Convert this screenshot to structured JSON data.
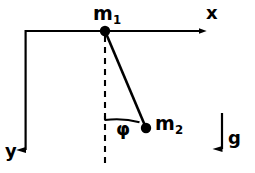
{
  "figure": {
    "background_color": "#ffffff",
    "stroke_color": "#000000",
    "width": 255,
    "height": 173,
    "labels": {
      "m1": {
        "base": "m",
        "sub": "1"
      },
      "m2": {
        "base": "m",
        "sub": "2"
      },
      "phi": "φ",
      "x_axis": "x",
      "y_axis": "y",
      "gravity": "g"
    },
    "geometry": {
      "origin": {
        "x": 25,
        "y": 31
      },
      "pivot_m1": {
        "x": 105,
        "y": 31,
        "radius": 5
      },
      "bob_m2": {
        "x": 146,
        "y": 128,
        "radius": 5
      },
      "x_axis_line": {
        "x1": 25,
        "y1": 31,
        "x2": 200,
        "y2": 31
      },
      "y_axis_line": {
        "x1": 25,
        "y1": 31,
        "x2": 25,
        "y2": 152
      },
      "gravity_arrow": {
        "x1": 222,
        "y1": 113,
        "x2": 222,
        "y2": 152
      },
      "rod": {
        "x1": 105,
        "y1": 31,
        "x2": 146,
        "y2": 128
      },
      "dashed_vertical": {
        "x": 105,
        "y1": 36,
        "y2": 166,
        "dash": 6,
        "gap": 5
      },
      "angle_arc": {
        "center_x": 105,
        "center_y": 31,
        "radius": 89,
        "start_deg": 90,
        "end_deg": 67
      },
      "angle_value_deg": 23
    },
    "icons": {
      "x_arrow": "arrow-right-icon",
      "y_arrow": "arrow-down-icon",
      "g_arrow": "arrow-down-icon"
    }
  }
}
